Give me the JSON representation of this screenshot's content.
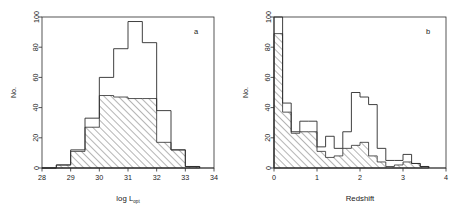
{
  "figure": {
    "panels": [
      {
        "id": "a",
        "label": "a",
        "xlabel_main": "log L",
        "xlabel_sub": "opt",
        "ylabel": "No."
      },
      {
        "id": "b",
        "label": "b",
        "xlabel_main": "Redshift",
        "xlabel_sub": "",
        "ylabel": "No."
      }
    ],
    "colors": {
      "ink": "#2b2b2b",
      "background": "#ffffff"
    }
  },
  "chart_data": [
    {
      "type": "bar",
      "id": "panel-a",
      "title": "",
      "panel_label": "a",
      "xlabel": "log L_opt",
      "ylabel": "No.",
      "xlim": [
        28,
        34
      ],
      "ylim": [
        0,
        100
      ],
      "xticks": [
        28,
        29,
        30,
        31,
        32,
        33,
        34
      ],
      "yticks": [
        0,
        20,
        40,
        60,
        80,
        100
      ],
      "xtick_labels": [
        "28",
        "29",
        "30",
        "31",
        "32",
        "33",
        "34"
      ],
      "ytick_labels": [
        "0",
        "20",
        "40",
        "60",
        "80",
        "100"
      ],
      "grid": false,
      "legend": "none",
      "bin_width": 0.5,
      "bin_edges": [
        28.0,
        28.5,
        29.0,
        29.5,
        30.0,
        30.5,
        31.0,
        31.5,
        32.0,
        32.5,
        33.0,
        33.5
      ],
      "series": [
        {
          "name": "total (open outline)",
          "style": "open",
          "values": [
            0,
            2,
            12,
            33,
            60,
            79,
            97,
            83,
            38,
            12,
            1
          ]
        },
        {
          "name": "detected (hatched)",
          "style": "hatched",
          "values": [
            0,
            2,
            11,
            27,
            48,
            47,
            46,
            46,
            17,
            12,
            1
          ]
        }
      ]
    },
    {
      "type": "bar",
      "id": "panel-b",
      "title": "",
      "panel_label": "b",
      "xlabel": "Redshift",
      "ylabel": "No.",
      "xlim": [
        0,
        4
      ],
      "ylim": [
        0,
        100
      ],
      "xticks": [
        0,
        1,
        2,
        3,
        4
      ],
      "yticks": [
        0,
        20,
        40,
        60,
        80,
        100
      ],
      "xtick_labels": [
        "0",
        "1",
        "2",
        "3",
        "4"
      ],
      "ytick_labels": [
        "0",
        "20",
        "40",
        "60",
        "80",
        "100"
      ],
      "grid": false,
      "legend": "none",
      "bin_width": 0.2,
      "bin_edges": [
        0.0,
        0.2,
        0.4,
        0.6,
        0.8,
        1.0,
        1.2,
        1.4,
        1.6,
        1.8,
        2.0,
        2.2,
        2.4,
        2.6,
        2.8,
        3.0,
        3.2,
        3.4,
        3.6
      ],
      "series": [
        {
          "name": "total (open outline)",
          "style": "open",
          "values": [
            100,
            43,
            24,
            31,
            31,
            14,
            21,
            13,
            24,
            50,
            47,
            42,
            13,
            5,
            5,
            9,
            3,
            1
          ]
        },
        {
          "name": "detected (hatched)",
          "style": "hatched",
          "values": [
            89,
            37,
            23,
            24,
            24,
            11,
            7,
            8,
            13,
            15,
            17,
            8,
            4,
            1,
            2,
            4,
            3,
            1
          ]
        }
      ]
    }
  ]
}
